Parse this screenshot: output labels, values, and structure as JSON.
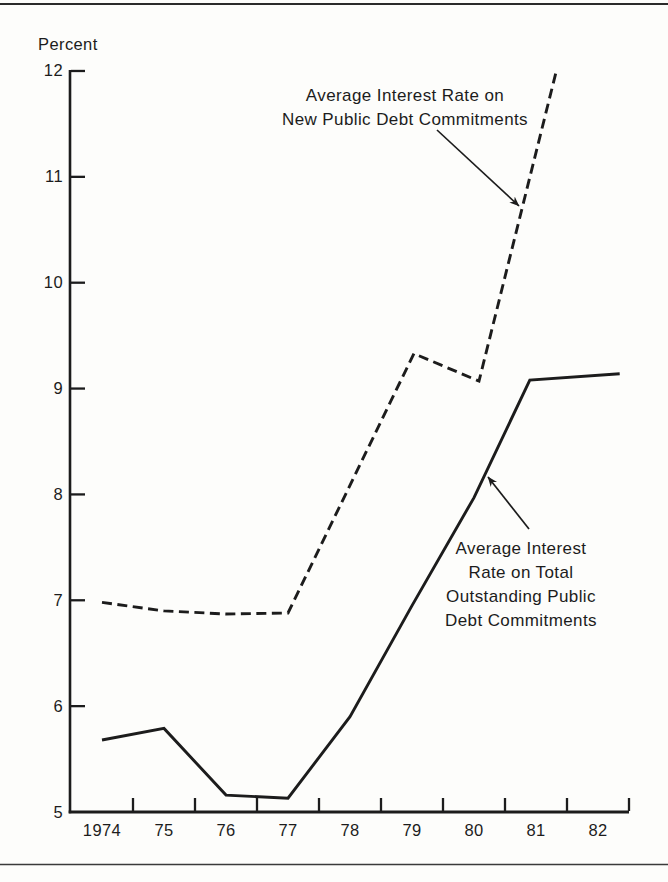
{
  "figure": {
    "y_axis_title": "Percent"
  },
  "colors": {
    "ink": "#1c1c1c",
    "background": "#fdfdfb"
  },
  "chart_data": {
    "type": "line",
    "title": "",
    "xlabel": "",
    "ylabel": "Percent",
    "ylim": [
      5,
      12
    ],
    "xlim": [
      1973.5,
      1982.5
    ],
    "grid": false,
    "legend_position": "none (inline arrow annotations)",
    "y_ticks": [
      5,
      6,
      7,
      8,
      9,
      10,
      11,
      12
    ],
    "x_tick_labels": [
      "1974",
      "75",
      "76",
      "77",
      "78",
      "79",
      "80",
      "81",
      "82"
    ],
    "x_tick_years": [
      1974,
      1975,
      1976,
      1977,
      1978,
      1979,
      1980,
      1981,
      1982
    ],
    "series": [
      {
        "id": "new",
        "name": "Average Interest Rate on New Public Debt Commitments",
        "line_style": "dashed",
        "categories": [
          1974,
          1975,
          1976,
          1977,
          1978,
          1979,
          1980,
          1981
        ],
        "values": [
          7.0,
          6.9,
          6.9,
          6.9,
          8.1,
          9.35,
          9.1,
          11.2
        ],
        "note": "line runs off the top of the plot (~12%) just after 1981",
        "points": [
          [
            1974,
            6.98
          ],
          [
            1975,
            6.9
          ],
          [
            1976,
            6.87
          ],
          [
            1977,
            6.88
          ],
          [
            1979.03,
            9.33
          ],
          [
            1980.08,
            9.07
          ],
          [
            1981.32,
            11.98
          ]
        ]
      },
      {
        "id": "outstanding",
        "name": "Average Interest Rate on Total Outstanding Public Debt Commitments",
        "line_style": "solid",
        "categories": [
          1974,
          1975,
          1976,
          1977,
          1978,
          1979,
          1980,
          1981,
          1982
        ],
        "values": [
          5.7,
          5.8,
          5.2,
          5.15,
          5.9,
          6.95,
          7.95,
          9.1,
          9.15
        ],
        "points": [
          [
            1974,
            5.68
          ],
          [
            1975,
            5.79
          ],
          [
            1976,
            5.16
          ],
          [
            1977,
            5.13
          ],
          [
            1978,
            5.9
          ],
          [
            1979,
            6.95
          ],
          [
            1980,
            7.97
          ],
          [
            1980.9,
            9.08
          ],
          [
            1982.35,
            9.14
          ]
        ]
      }
    ],
    "annotations": [
      {
        "target_series": "new",
        "lines": [
          "Average Interest Rate on",
          "New Public Debt Commitments"
        ]
      },
      {
        "target_series": "outstanding",
        "lines": [
          "Average Interest",
          "Rate on Total",
          "Outstanding Public",
          "Debt Commitments"
        ]
      }
    ]
  }
}
